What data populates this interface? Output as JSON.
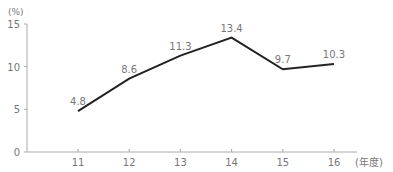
{
  "chart_data": {
    "type": "line",
    "title": "",
    "xlabel": "(年度)",
    "ylabel": "(%)",
    "categories": [
      "11",
      "12",
      "13",
      "14",
      "15",
      "16"
    ],
    "values": [
      4.8,
      8.6,
      11.3,
      13.4,
      9.7,
      10.3
    ],
    "data_labels": [
      "4.8",
      "8.6",
      "11.3",
      "13.4",
      "9.7",
      "10.3"
    ],
    "yticks": [
      "0",
      "5",
      "10",
      "15"
    ],
    "ylim": [
      0,
      15
    ],
    "grid": false,
    "legend": null,
    "colors": {
      "line": "#222222",
      "axis": "#aaaaaa",
      "text": "#777777"
    }
  }
}
